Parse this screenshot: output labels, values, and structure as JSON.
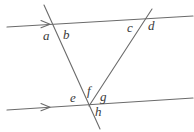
{
  "figure": {
    "name": "parallel-lines-transversals-angle-diagram",
    "width": 194,
    "height": 132,
    "background_color": "#ffffff",
    "line_color": "#6b6b6b",
    "label_color": "#3a3a3a",
    "stroke_width": 1.1
  },
  "lines": {
    "parallel_top": {
      "label": "top-parallel-line",
      "x1": 7,
      "y1": 27,
      "x2": 193,
      "y2": 16,
      "arrow": "right",
      "arrow_at_x": 48,
      "arrow_at_y": 24
    },
    "parallel_bottom": {
      "label": "bottom-parallel-line",
      "x1": 7,
      "y1": 110,
      "x2": 193,
      "y2": 98,
      "arrow": "right",
      "arrow_at_x": 48,
      "arrow_at_y": 107
    },
    "transversal_descending": {
      "label": "descending-transversal",
      "x1": 44,
      "y1": 5,
      "x2": 100,
      "y2": 129
    },
    "transversal_ascending": {
      "label": "ascending-transversal",
      "x1": 89,
      "y1": 106,
      "x2": 152,
      "y2": 9
    }
  },
  "intersections": {
    "top_left": {
      "x": 52,
      "y": 26
    },
    "top_right": {
      "x": 145,
      "y": 18
    },
    "bottom": {
      "x": 89,
      "y": 106
    }
  },
  "angle_labels": [
    {
      "id": "a",
      "text": "a",
      "x": 43,
      "y": 29
    },
    {
      "id": "b",
      "text": "b",
      "x": 63,
      "y": 28
    },
    {
      "id": "c",
      "text": "c",
      "x": 127,
      "y": 21
    },
    {
      "id": "d",
      "text": "d",
      "x": 148,
      "y": 19
    },
    {
      "id": "e",
      "text": "e",
      "x": 70,
      "y": 91
    },
    {
      "id": "f",
      "text": "f",
      "x": 87,
      "y": 84
    },
    {
      "id": "g",
      "text": "g",
      "x": 100,
      "y": 90
    },
    {
      "id": "h",
      "text": "h",
      "x": 95,
      "y": 105
    }
  ]
}
